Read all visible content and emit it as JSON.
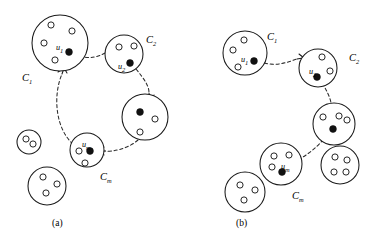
{
  "figure": {
    "type": "diagram",
    "background_color": "#ffffff",
    "stroke_color": "#1a1a1a",
    "node_fill_open": "#ffffff",
    "node_fill_selected": "#111111",
    "link_style": "dashed-arrow",
    "panels": [
      {
        "id": "a",
        "label": "(a)",
        "label_pos": [
          52,
          218
        ],
        "clusters": [
          {
            "name": "C1",
            "label": "C",
            "sub": "1",
            "label_pos": [
              22,
              73
            ],
            "cx": 60,
            "cy": 43,
            "r": 28,
            "rep": {
              "label": "u",
              "sub": "1",
              "cx": 69,
              "cy": 52,
              "label_pos": [
                56,
                44
              ]
            },
            "members": [
              {
                "cx": 51,
                "cy": 25
              },
              {
                "cx": 72,
                "cy": 31
              },
              {
                "cx": 44,
                "cy": 43
              },
              {
                "cx": 55,
                "cy": 60
              }
            ]
          },
          {
            "name": "C2",
            "label": "C",
            "sub": "2",
            "label_pos": [
              146,
              35
            ],
            "cx": 124,
            "cy": 54,
            "r": 19,
            "rep": {
              "label": "u",
              "sub": "2",
              "cx": 130,
              "cy": 63,
              "label_pos": [
                118,
                63
              ]
            },
            "members": [
              {
                "cx": 119,
                "cy": 47
              },
              {
                "cx": 134,
                "cy": 46
              }
            ]
          },
          {
            "name": "C3",
            "label": "",
            "sub": "",
            "label_pos": [
              0,
              0
            ],
            "cx": 145,
            "cy": 117,
            "r": 23,
            "rep": {
              "label": "",
              "sub": "",
              "cx": 140,
              "cy": 112,
              "label_pos": [
                0,
                0
              ]
            },
            "members": [
              {
                "cx": 155,
                "cy": 119
              },
              {
                "cx": 140,
                "cy": 132
              }
            ]
          },
          {
            "name": "Cm",
            "label": "C",
            "sub": "m",
            "label_pos": [
              100,
              172
            ],
            "cx": 87,
            "cy": 150,
            "r": 17,
            "rep": {
              "label": "u",
              "sub": "m",
              "cx": 90,
              "cy": 151,
              "label_pos": [
                82,
                141
              ]
            },
            "members": [
              {
                "cx": 79,
                "cy": 151
              },
              {
                "cx": 85,
                "cy": 163
              }
            ]
          },
          {
            "name": "free-small",
            "label": "",
            "sub": "",
            "label_pos": [
              0,
              0
            ],
            "cx": 29,
            "cy": 142,
            "r": 12,
            "rep": null,
            "members": [
              {
                "cx": 26,
                "cy": 139
              },
              {
                "cx": 33,
                "cy": 144
              }
            ]
          },
          {
            "name": "free-large",
            "label": "",
            "sub": "",
            "label_pos": [
              0,
              0
            ],
            "cx": 47,
            "cy": 186,
            "r": 19,
            "rep": null,
            "members": [
              {
                "cx": 43,
                "cy": 177
              },
              {
                "cx": 57,
                "cy": 184
              },
              {
                "cx": 46,
                "cy": 193
              }
            ]
          }
        ],
        "links": [
          {
            "from": "C1",
            "to": "C2",
            "path": "M 74 54 C 90 61, 100 56, 107 52",
            "arrow": "M 107 52 L 113 53 M 109 48 L 113 53 L 108 56"
          },
          {
            "from": "C2",
            "to": "C3",
            "path": "M 136 69 C 145 80, 149 86, 149 93",
            "arrow": "M 149 93 L 150 99 M 145 95 L 150 100 L 154 95"
          },
          {
            "from": "C3",
            "to": "Cm",
            "path": "M 138 140 C 128 149, 112 152, 105 151",
            "arrow": "M 105 151 L 99 151 M 104 147 L 99 151 L 104 155"
          },
          {
            "from": "Cm",
            "to": "C1",
            "path": "M 73 144 C 55 128, 53 95, 62 74",
            "arrow": "M 62 74 L 64 68 M 58 72 L 64 68 L 67 73"
          }
        ]
      },
      {
        "id": "b",
        "label": "(b)",
        "label_pos": [
          236,
          218
        ],
        "clusters": [
          {
            "name": "C1",
            "label": "C",
            "sub": "1",
            "label_pos": [
              267,
              32
            ],
            "cx": 245,
            "cy": 53,
            "r": 22,
            "rep": {
              "label": "u",
              "sub": "1",
              "cx": 254,
              "cy": 61,
              "label_pos": [
                241,
                56
              ]
            },
            "members": [
              {
                "cx": 244,
                "cy": 40
              },
              {
                "cx": 233,
                "cy": 50
              },
              {
                "cx": 238,
                "cy": 67
              }
            ]
          },
          {
            "name": "C2",
            "label": "C",
            "sub": "2",
            "label_pos": [
              349,
              53
            ],
            "cx": 318,
            "cy": 68,
            "r": 19,
            "rep": {
              "label": "u",
              "sub": "2",
              "cx": 317,
              "cy": 77,
              "label_pos": [
                309,
                68
              ]
            },
            "members": [
              {
                "cx": 322,
                "cy": 57
              },
              {
                "cx": 330,
                "cy": 71
              }
            ]
          },
          {
            "name": "C3",
            "label": "",
            "sub": "",
            "label_pos": [
              0,
              0
            ],
            "cx": 334,
            "cy": 124,
            "r": 21,
            "rep": {
              "label": "",
              "sub": "",
              "cx": 333,
              "cy": 129,
              "label_pos": [
                0,
                0
              ]
            },
            "members": [
              {
                "cx": 323,
                "cy": 117
              },
              {
                "cx": 339,
                "cy": 116
              },
              {
                "cx": 347,
                "cy": 120
              }
            ]
          },
          {
            "name": "Cm",
            "label": "C",
            "sub": "m",
            "label_pos": [
              292,
              191
            ],
            "cx": 281,
            "cy": 164,
            "r": 21,
            "rep": {
              "label": "u",
              "sub": "m",
              "cx": 282,
              "cy": 172,
              "label_pos": [
                281,
                163
              ]
            },
            "members": [
              {
                "cx": 274,
                "cy": 156
              },
              {
                "cx": 289,
                "cy": 155
              },
              {
                "cx": 272,
                "cy": 167
              }
            ]
          },
          {
            "name": "free-right",
            "label": "",
            "sub": "",
            "label_pos": [
              0,
              0
            ],
            "cx": 340,
            "cy": 165,
            "r": 19,
            "rep": null,
            "members": [
              {
                "cx": 335,
                "cy": 157
              },
              {
                "cx": 347,
                "cy": 160
              },
              {
                "cx": 334,
                "cy": 172
              },
              {
                "cx": 346,
                "cy": 172
              }
            ]
          },
          {
            "name": "free-bottom",
            "label": "",
            "sub": "",
            "label_pos": [
              0,
              0
            ],
            "cx": 245,
            "cy": 192,
            "r": 20,
            "rep": null,
            "members": [
              {
                "cx": 240,
                "cy": 185
              },
              {
                "cx": 255,
                "cy": 190
              },
              {
                "cx": 244,
                "cy": 200
              }
            ]
          }
        ],
        "links": [
          {
            "from": "C1",
            "to": "C2",
            "path": "M 259 61 C 274 68, 288 62, 297 59",
            "arrow": "M 297 59 L 303 58 M 299 54 L 304 58 L 300 62"
          },
          {
            "from": "C2",
            "to": "C3",
            "path": "M 322 83 C 327 91, 330 97, 331 103",
            "arrow": "M 331 103 L 332 108 M 327 104 L 332 109 L 336 104"
          },
          {
            "from": "C3",
            "to": "Cm",
            "path": "M 327 135 C 318 147, 307 155, 298 160",
            "arrow": "M 298 160 L 293 162 M 297 157 L 292 162 L 297 166"
          }
        ]
      }
    ]
  }
}
